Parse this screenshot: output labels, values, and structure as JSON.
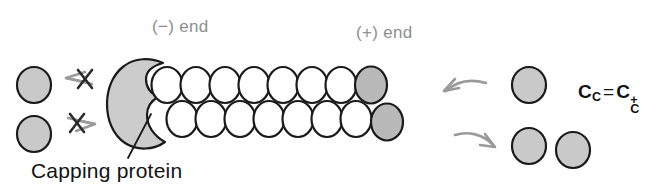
{
  "figure": {
    "background_color": "#ffffff"
  },
  "labels": {
    "minus_end": "(−) end",
    "plus_end": "(+) end",
    "capping_protein": "Capping protein",
    "label_color_gray": "#8e8e8e",
    "label_color_black": "#121212"
  },
  "equation": {
    "lhs_base": "C",
    "lhs_sub": "C",
    "operator": "=",
    "rhs_base": "C",
    "rhs_sub": "C",
    "rhs_sup": "+",
    "plain_text": "C_C = C_C^+"
  },
  "colors": {
    "subunit_free_fill": "#c9c9c9",
    "subunit_bound_fill": "#ffffff",
    "subunit_tip_fill": "#b9b9b9",
    "subunit_stroke": "#1a1a1a",
    "capping_protein_fill": "#cccccc",
    "capping_protein_stroke": "#1a1a1a",
    "arrow_gray": "#9a9a9a",
    "cross_dark": "#2a2a2a",
    "leader_line": "#1a1a1a"
  },
  "filament": {
    "top_row": {
      "count": 8,
      "white_count": 7,
      "gray_tip_count": 1,
      "start_x": 167,
      "start_y": 85,
      "spacing": 29,
      "rx": 15.5,
      "ry": 18
    },
    "bottom_row": {
      "count": 8,
      "white_count": 7,
      "gray_tip_count": 1,
      "start_x": 182,
      "start_y": 119,
      "spacing": 29,
      "rx": 15.5,
      "ry": 18
    }
  },
  "free_subunits": {
    "left": [
      {
        "name": "left-free-subunit-upper",
        "cx": 34,
        "cy": 85,
        "rx": 17,
        "ry": 18
      },
      {
        "name": "left-free-subunit-lower",
        "cx": 34,
        "cy": 134,
        "rx": 17,
        "ry": 18
      }
    ],
    "right": [
      {
        "name": "right-free-subunit-upper",
        "cx": 529,
        "cy": 85,
        "rx": 17,
        "ry": 18
      },
      {
        "name": "right-free-subunit-lower-inner",
        "cx": 529,
        "cy": 146,
        "rx": 17,
        "ry": 18
      },
      {
        "name": "right-free-subunit-lower-outer",
        "cx": 573,
        "cy": 150,
        "rx": 17,
        "ry": 18
      }
    ]
  },
  "arrows": {
    "minus_end_association_blocked": {
      "direction": "left",
      "crossed_out": true,
      "meaning": "subunit addition at minus end is blocked"
    },
    "minus_end_dissociation_blocked": {
      "direction": "right",
      "crossed_out": true,
      "meaning": "subunit loss at minus end is blocked"
    },
    "plus_end_association": {
      "direction": "left",
      "crossed_out": false,
      "meaning": "subunit addition at plus end"
    },
    "plus_end_dissociation": {
      "direction": "right",
      "crossed_out": false,
      "meaning": "subunit loss at plus end"
    }
  }
}
